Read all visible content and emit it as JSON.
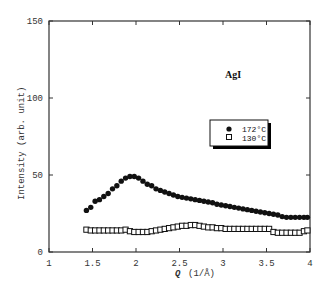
{
  "chart_data": {
    "type": "scatter",
    "title": "",
    "annotation": "AgI",
    "xlabel": "Q  (1/Å)",
    "ylabel": "Intensity (arb. unit)",
    "xlim": [
      1,
      4
    ],
    "ylim": [
      0,
      150
    ],
    "xticks": [
      1,
      1.5,
      2,
      2.5,
      3,
      3.5,
      4
    ],
    "xtick_labels": [
      "1",
      "1.5",
      "2",
      "2.5",
      "3",
      "3.5",
      "4"
    ],
    "yticks": [
      0,
      50,
      100,
      150
    ],
    "ytick_labels": [
      "0",
      "50",
      "100",
      "150"
    ],
    "grid": false,
    "legend_position": "upper right (inside)",
    "series": [
      {
        "name": "172°C",
        "marker": "filled-circle",
        "x": [
          1.43,
          1.48,
          1.53,
          1.58,
          1.63,
          1.68,
          1.73,
          1.78,
          1.83,
          1.88,
          1.93,
          1.98,
          2.03,
          2.08,
          2.13,
          2.18,
          2.23,
          2.28,
          2.33,
          2.38,
          2.43,
          2.48,
          2.53,
          2.58,
          2.63,
          2.68,
          2.73,
          2.78,
          2.83,
          2.88,
          2.93,
          2.98,
          3.03,
          3.08,
          3.13,
          3.18,
          3.23,
          3.28,
          3.33,
          3.38,
          3.43,
          3.48,
          3.53,
          3.58,
          3.63,
          3.68,
          3.73,
          3.78,
          3.83,
          3.88,
          3.93,
          3.97
        ],
        "values": [
          27,
          29,
          33,
          34,
          36,
          38,
          41,
          43,
          46,
          48,
          49,
          49,
          48,
          46,
          44,
          43,
          41,
          40,
          39,
          38,
          37,
          36,
          35.5,
          35,
          34.5,
          34,
          33.5,
          33,
          32.5,
          32,
          31,
          30.5,
          30,
          29.5,
          29,
          28.5,
          28,
          27.5,
          27,
          26.5,
          26,
          25.5,
          25,
          24.5,
          24,
          23,
          22.5,
          22.5,
          22.5,
          22.5,
          22.5,
          22.5
        ]
      },
      {
        "name": "130°C",
        "marker": "open-square",
        "x": [
          1.43,
          1.48,
          1.53,
          1.58,
          1.63,
          1.68,
          1.73,
          1.78,
          1.83,
          1.88,
          1.93,
          1.98,
          2.03,
          2.08,
          2.13,
          2.18,
          2.23,
          2.28,
          2.33,
          2.38,
          2.43,
          2.48,
          2.53,
          2.58,
          2.63,
          2.68,
          2.73,
          2.78,
          2.83,
          2.88,
          2.93,
          2.98,
          3.03,
          3.08,
          3.13,
          3.18,
          3.23,
          3.28,
          3.33,
          3.38,
          3.43,
          3.48,
          3.53,
          3.58,
          3.63,
          3.68,
          3.73,
          3.78,
          3.83,
          3.88,
          3.93,
          3.97
        ],
        "values": [
          14.5,
          14,
          14,
          14,
          14,
          14,
          14,
          14,
          14,
          14.5,
          13.5,
          13,
          13,
          13,
          13,
          13.5,
          14,
          14.5,
          15,
          15.5,
          16,
          16.5,
          17,
          17,
          17.5,
          17.5,
          17,
          16.5,
          16,
          16,
          15.5,
          15.5,
          15,
          15,
          15,
          15,
          15,
          15,
          15,
          15,
          15,
          15,
          15,
          13,
          12.5,
          12.5,
          12.5,
          12.5,
          12.5,
          12.5,
          13.5,
          14
        ]
      }
    ]
  },
  "labels": {
    "annotation": "AgI",
    "xlabel_q": "Q",
    "xlabel_unit": "(1/Å)",
    "ylabel": "Intensity (arb. unit)",
    "legend_172": "172°C",
    "legend_130": "130°C"
  }
}
